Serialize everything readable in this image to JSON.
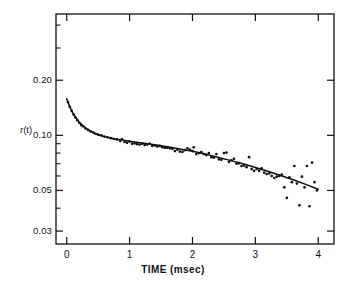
{
  "figure": {
    "background": "#ffffff",
    "ink": "#111111",
    "frame": {
      "left": 56,
      "right": 334,
      "top": 14,
      "bottom": 244
    }
  },
  "chart_data": {
    "type": "scatter",
    "title": "",
    "subtitle": "",
    "xlabel": "TIME  (msec)",
    "ylabel": "r(t)",
    "yscale": "log",
    "xscale": "linear",
    "xlim": [
      -0.17,
      4.25
    ],
    "ylim": [
      0.0255,
      0.46
    ],
    "grid": false,
    "legend": null,
    "xticks": [
      0,
      1,
      2,
      3,
      4
    ],
    "xticklabels": [
      "0",
      "1",
      "2",
      "3",
      "4"
    ],
    "yticks": [
      0.2,
      0.1,
      0.05,
      0.03
    ],
    "yticklabels": [
      "0.20",
      "0.10",
      "0.05",
      "0.03"
    ],
    "y_minor_ticks": [
      0.4,
      0.3,
      0.09,
      0.08,
      0.07,
      0.06,
      0.04
    ],
    "series": [
      {
        "name": "data",
        "marker": "dot",
        "color": "#111111",
        "points": [
          [
            0.02,
            0.152
          ],
          [
            0.05,
            0.143
          ],
          [
            0.08,
            0.136
          ],
          [
            0.11,
            0.13
          ],
          [
            0.14,
            0.125
          ],
          [
            0.17,
            0.121
          ],
          [
            0.2,
            0.117
          ],
          [
            0.23,
            0.114
          ],
          [
            0.26,
            0.112
          ],
          [
            0.3,
            0.109
          ],
          [
            0.34,
            0.107
          ],
          [
            0.38,
            0.105
          ],
          [
            0.42,
            0.104
          ],
          [
            0.46,
            0.102
          ],
          [
            0.5,
            0.101
          ],
          [
            0.55,
            0.1
          ],
          [
            0.6,
            0.0985
          ],
          [
            0.65,
            0.0975
          ],
          [
            0.7,
            0.0965
          ],
          [
            0.75,
            0.0955
          ],
          [
            0.8,
            0.095
          ],
          [
            0.85,
            0.093
          ],
          [
            0.88,
            0.0955
          ],
          [
            0.92,
            0.092
          ],
          [
            0.96,
            0.091
          ],
          [
            1.0,
            0.0925
          ],
          [
            1.04,
            0.09
          ],
          [
            1.08,
            0.0905
          ],
          [
            1.12,
            0.0895
          ],
          [
            1.16,
            0.089
          ],
          [
            1.2,
            0.09
          ],
          [
            1.24,
            0.0885
          ],
          [
            1.28,
            0.089
          ],
          [
            1.32,
            0.09
          ],
          [
            1.36,
            0.0875
          ],
          [
            1.4,
            0.088
          ],
          [
            1.44,
            0.087
          ],
          [
            1.48,
            0.0875
          ],
          [
            1.52,
            0.086
          ],
          [
            1.56,
            0.0855
          ],
          [
            1.6,
            0.0855
          ],
          [
            1.64,
            0.085
          ],
          [
            1.68,
            0.0845
          ],
          [
            1.72,
            0.082
          ],
          [
            1.76,
            0.0835
          ],
          [
            1.8,
            0.0815
          ],
          [
            1.84,
            0.0812
          ],
          [
            1.88,
            0.083
          ],
          [
            1.92,
            0.085
          ],
          [
            1.96,
            0.0835
          ],
          [
            2.0,
            0.082
          ],
          [
            2.02,
            0.086
          ],
          [
            2.06,
            0.079
          ],
          [
            2.1,
            0.08
          ],
          [
            2.14,
            0.081
          ],
          [
            2.18,
            0.079
          ],
          [
            2.22,
            0.078
          ],
          [
            2.26,
            0.08
          ],
          [
            2.3,
            0.076
          ],
          [
            2.34,
            0.0755
          ],
          [
            2.38,
            0.079
          ],
          [
            2.42,
            0.074
          ],
          [
            2.46,
            0.0735
          ],
          [
            2.5,
            0.08
          ],
          [
            2.54,
            0.0805
          ],
          [
            2.58,
            0.0715
          ],
          [
            2.62,
            0.073
          ],
          [
            2.66,
            0.0745
          ],
          [
            2.7,
            0.07
          ],
          [
            2.74,
            0.0705
          ],
          [
            2.78,
            0.068
          ],
          [
            2.82,
            0.0685
          ],
          [
            2.86,
            0.067
          ],
          [
            2.9,
            0.076
          ],
          [
            2.94,
            0.0655
          ],
          [
            2.98,
            0.064
          ],
          [
            3.02,
            0.0655
          ],
          [
            3.06,
            0.064
          ],
          [
            3.1,
            0.066
          ],
          [
            3.14,
            0.0625
          ],
          [
            3.18,
            0.0615
          ],
          [
            3.22,
            0.062
          ],
          [
            3.26,
            0.06
          ],
          [
            3.3,
            0.0585
          ],
          [
            3.34,
            0.0595
          ],
          [
            3.38,
            0.06
          ],
          [
            3.42,
            0.061
          ],
          [
            3.46,
            0.052
          ],
          [
            3.5,
            0.0455
          ],
          [
            3.54,
            0.059
          ],
          [
            3.58,
            0.0555
          ],
          [
            3.62,
            0.068
          ],
          [
            3.66,
            0.0545
          ],
          [
            3.7,
            0.0415
          ],
          [
            3.74,
            0.0595
          ],
          [
            3.78,
            0.052
          ],
          [
            3.82,
            0.068
          ],
          [
            3.86,
            0.041
          ],
          [
            3.9,
            0.071
          ],
          [
            3.94,
            0.0555
          ],
          [
            3.98,
            0.05
          ]
        ]
      },
      {
        "name": "fit",
        "marker": "line",
        "color": "#111111",
        "points": [
          [
            0.0,
            0.1585
          ],
          [
            0.05,
            0.143
          ],
          [
            0.1,
            0.132
          ],
          [
            0.15,
            0.124
          ],
          [
            0.2,
            0.118
          ],
          [
            0.25,
            0.1135
          ],
          [
            0.3,
            0.1098
          ],
          [
            0.35,
            0.1068
          ],
          [
            0.4,
            0.1044
          ],
          [
            0.45,
            0.1024
          ],
          [
            0.5,
            0.1008
          ],
          [
            0.6,
            0.0984
          ],
          [
            0.7,
            0.0966
          ],
          [
            0.8,
            0.0952
          ],
          [
            0.9,
            0.094
          ],
          [
            1.0,
            0.0929
          ],
          [
            1.2,
            0.0908
          ],
          [
            1.4,
            0.0888
          ],
          [
            1.6,
            0.0866
          ],
          [
            1.8,
            0.0842
          ],
          [
            2.0,
            0.0818
          ],
          [
            2.2,
            0.079
          ],
          [
            2.4,
            0.076
          ],
          [
            2.6,
            0.073
          ],
          [
            2.8,
            0.07
          ],
          [
            3.0,
            0.0668
          ],
          [
            3.2,
            0.0636
          ],
          [
            3.4,
            0.0604
          ],
          [
            3.6,
            0.0572
          ],
          [
            3.8,
            0.054
          ],
          [
            4.0,
            0.0508
          ]
        ]
      }
    ]
  }
}
